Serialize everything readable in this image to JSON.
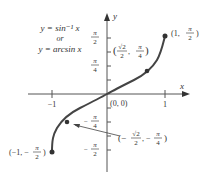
{
  "title": {
    "line1": "y = sin⁻¹ x",
    "line2": "or",
    "line3": "y = arcsin x"
  },
  "axes": {
    "x_label": "x",
    "y_label": "y",
    "x_ticks": [
      "−1",
      "1"
    ],
    "y_ticks": [
      {
        "num": "π",
        "den": "2",
        "sign": ""
      },
      {
        "num": "π",
        "den": "4",
        "sign": ""
      },
      {
        "num": "π",
        "den": "4",
        "sign": "−"
      },
      {
        "num": "π",
        "den": "2",
        "sign": "−"
      }
    ],
    "origin_label": "(0, 0)"
  },
  "points": [
    {
      "label": "(1, π/2)",
      "x": 1,
      "y": 1.5708
    },
    {
      "label": "(√2/2, π/4)",
      "x": 0.7071,
      "y": 0.7854
    },
    {
      "label": "(0, 0)",
      "x": 0,
      "y": 0
    },
    {
      "label": "(−√2/2, −π/4)",
      "x": -0.7071,
      "y": -0.7854
    },
    {
      "label": "(−1, −π/2)",
      "x": -1,
      "y": -1.5708
    }
  ],
  "point_labels": {
    "top_right": {
      "open": "(1, ",
      "num": "π",
      "den": "2",
      "close": ")"
    },
    "upper_mid": {
      "open": "(",
      "rnum": "√2",
      "rden": "2",
      "sep": ", ",
      "num": "π",
      "den": "4",
      "close": ")"
    },
    "lower_mid": {
      "open": "(−",
      "rnum": "√2",
      "rden": "2",
      "sep": ", −",
      "num": "π",
      "den": "4",
      "close": ")"
    },
    "bottom_left": {
      "open": "(−1, −",
      "num": "π",
      "den": "2",
      "close": ")"
    }
  },
  "colors": {
    "curve": "#444444",
    "axis": "#555555",
    "text": "#333333"
  }
}
